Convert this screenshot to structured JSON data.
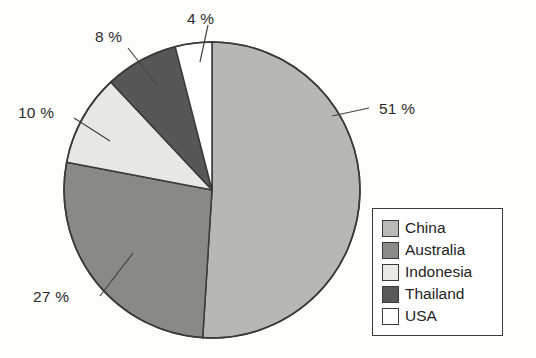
{
  "chart_data": {
    "type": "pie",
    "title": "",
    "subtitle": "",
    "xlabel": "",
    "ylabel": "",
    "grid": false,
    "legend_position": "bottom-right",
    "start_angle_deg": 0,
    "direction": "clockwise",
    "units": "percent",
    "total": 100,
    "categories": [
      "China",
      "Australia",
      "Indonesia",
      "Thailand",
      "USA"
    ],
    "values": [
      51,
      27,
      10,
      8,
      4
    ],
    "labels": [
      "51 %",
      "27 %",
      "10 %",
      "8 %",
      "4 %"
    ],
    "colors": [
      "#b9b9b5",
      "#8b8b89",
      "#e9e9e5",
      "#59595a",
      "#ffffff"
    ],
    "slices": [
      {
        "name": "China",
        "value": 51,
        "label": "51 %",
        "color": "#b9b9b5"
      },
      {
        "name": "Australia",
        "value": 27,
        "label": "27 %",
        "color": "#8b8b89"
      },
      {
        "name": "Indonesia",
        "value": 10,
        "label": "10 %",
        "color": "#e9e9e5"
      },
      {
        "name": "Thailand",
        "value": 8,
        "label": "8 %",
        "color": "#59595a"
      },
      {
        "name": "USA",
        "value": 4,
        "label": "4 %",
        "color": "#ffffff"
      }
    ]
  },
  "pie": {
    "center_x": 212,
    "center_y": 190,
    "radius": 148,
    "outline_color": "#3a3a38",
    "label_51": "51 %",
    "label_27": "27 %",
    "label_10": "10 %",
    "label_8": "8 %",
    "label_4": "4 %"
  },
  "legend": {
    "items": [
      {
        "label": "China",
        "color": "#b9b9b5"
      },
      {
        "label": "Australia",
        "color": "#8b8b89"
      },
      {
        "label": "Indonesia",
        "color": "#e9e9e5"
      },
      {
        "label": "Thailand",
        "color": "#59595a"
      },
      {
        "label": "USA",
        "color": "#ffffff"
      }
    ]
  }
}
